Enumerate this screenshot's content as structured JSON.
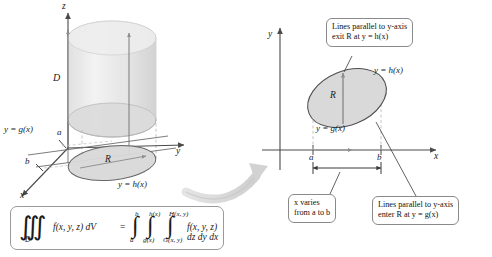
{
  "figure": {
    "colors": {
      "axis": "#4a4a4a",
      "solid_fill": "#e6e6e6",
      "region_fill": "#d9d9d9",
      "region_stroke": "#555555",
      "dashed": "#b0b0b0",
      "callout_border": "#8a8a8a",
      "big_arrow": "#d5d5d5",
      "text": "#1a1a1a"
    }
  },
  "left_panel": {
    "name": "3d-solid-panel",
    "axes": {
      "z": "z",
      "y": "y",
      "x": "x"
    },
    "solid_label": "D",
    "region_label": "R",
    "curve_lower": "y = g(x)",
    "curve_upper": "y = h(x)",
    "tick_a": "a",
    "tick_b": "b"
  },
  "right_panel": {
    "name": "2d-region-panel",
    "axes": {
      "y": "y",
      "x": "x"
    },
    "region_label": "R",
    "curve_upper": "y = h(x)",
    "curve_lower": "y = g(x)",
    "tick_a": "a",
    "tick_b": "b",
    "callouts": [
      {
        "id": "exit-callout",
        "line1": "Lines parallel to y-axis",
        "line2": "exit R at y = h(x)"
      },
      {
        "id": "enter-callout",
        "line1": "Lines parallel to y-axis",
        "line2": "enter R at y = g(x)"
      },
      {
        "id": "x-range-callout",
        "line1": "x varies",
        "line2": "from a to b"
      }
    ]
  },
  "formula": {
    "name": "triple-integral-formula",
    "lhs_integral": "∭",
    "lhs_sub": "D",
    "lhs_body": "f(x, y, z) dV",
    "equals": "=",
    "outer_upper": "b",
    "outer_lower": "a",
    "middle_upper": "h(x)",
    "middle_lower": "g(x)",
    "inner_upper": "H(x, y)",
    "inner_lower": "G(x, y)",
    "rhs_body": "f(x, y, z) dz dy dx"
  }
}
